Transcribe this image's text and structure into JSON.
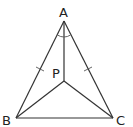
{
  "diagram": {
    "type": "geometry",
    "points": {
      "A": {
        "label": "A",
        "x": 64,
        "y": 21
      },
      "B": {
        "label": "B",
        "x": 16,
        "y": 118
      },
      "C": {
        "label": "C",
        "x": 113,
        "y": 118
      },
      "P": {
        "label": "P",
        "x": 64,
        "y": 81
      }
    },
    "segments": [
      "AB",
      "AC",
      "BC",
      "AP",
      "BP",
      "CP"
    ],
    "marks": {
      "equal_sides": [
        "AB",
        "AC"
      ],
      "angle_arcs": [
        "BAP",
        "PAC"
      ]
    },
    "colors": {
      "line": "#333333",
      "label": "#222222",
      "background": "#ffffff"
    }
  }
}
